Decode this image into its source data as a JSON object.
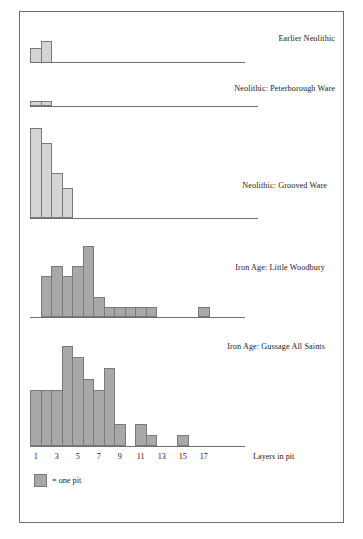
{
  "figure": {
    "axis_label": "Layers in pit",
    "legend_text": "= one pit",
    "legend_swatch_color": "#a8a8a8",
    "bar_color_light": "#d4d4d4",
    "bar_color_dark": "#a8a8a8",
    "border_color": "#7a7a7a"
  },
  "chart_data": {
    "type": "bar",
    "title": "",
    "xlabel": "Layers in pit",
    "ylabel": "Number of pits (one square = one pit)",
    "xlim": [
      0,
      18
    ],
    "grid": false,
    "legend_position": "bottom-left",
    "legend_entries": [
      "= one pit"
    ],
    "tick_labels": [
      "1",
      "3",
      "5",
      "7",
      "9",
      "11",
      "13",
      "15",
      "17"
    ],
    "tick_values": [
      1,
      3,
      5,
      7,
      9,
      11,
      13,
      15,
      17
    ],
    "annotations": [
      "Earlier Neolithic",
      "Neolithic: Peterborough Ware",
      "Neolithic: Grooved Ware",
      "Iron Age: Little Woodbury",
      "Iron Age: Gussage All Saints"
    ],
    "panels": [
      {
        "name": "Earlier Neolithic",
        "shade": "light",
        "categories": [
          1,
          2
        ],
        "values": [
          2,
          3
        ],
        "ymax": 6
      },
      {
        "name": "Neolithic: Peterborough Ware",
        "shade": "light",
        "categories": [
          1,
          2
        ],
        "values": [
          1,
          1
        ],
        "ymax": 6
      },
      {
        "name": "Neolithic: Grooved Ware",
        "shade": "light",
        "categories": [
          1,
          2,
          3,
          4
        ],
        "values": [
          6,
          5,
          3,
          2
        ],
        "ymax": 6
      },
      {
        "name": "Iron Age: Little Woodbury",
        "shade": "dark",
        "categories": [
          1,
          2,
          3,
          4,
          5,
          6,
          7,
          8,
          9,
          10,
          11,
          12,
          13,
          14,
          15,
          16,
          17
        ],
        "values": [
          0,
          4,
          5,
          4,
          5,
          7,
          2,
          1,
          1,
          1,
          1,
          1,
          0,
          0,
          0,
          0,
          1
        ],
        "ymax": 7
      },
      {
        "name": "Iron Age: Gussage All Saints",
        "shade": "dark",
        "categories": [
          1,
          2,
          3,
          4,
          5,
          6,
          7,
          8,
          9,
          10,
          11,
          12,
          13,
          14,
          15,
          16,
          17
        ],
        "values": [
          5,
          5,
          5,
          9,
          8,
          6,
          5,
          7,
          2,
          0,
          2,
          1,
          0,
          0,
          1,
          0,
          0
        ],
        "ymax": 9
      }
    ]
  }
}
